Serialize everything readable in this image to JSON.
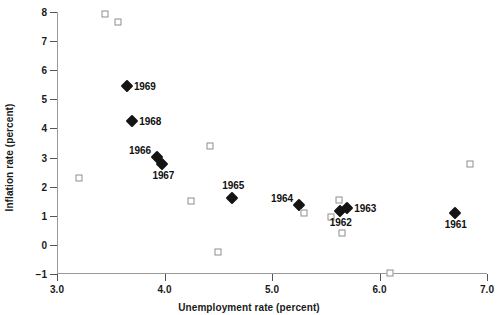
{
  "chart_data": {
    "type": "scatter",
    "title": "",
    "xlabel": "Unemployment rate (percent)",
    "ylabel": "Inflation rate (percent)",
    "xlim": [
      3.0,
      7.0
    ],
    "ylim": [
      -1,
      8
    ],
    "xticks": [
      "3.0",
      "4.0",
      "5.0",
      "6.0",
      "7.0"
    ],
    "xtick_values": [
      3.0,
      4.0,
      5.0,
      6.0,
      7.0
    ],
    "yticks": [
      "8",
      "7",
      "6",
      "5",
      "4",
      "3",
      "2",
      "1",
      "0",
      "−1"
    ],
    "ytick_values": [
      8,
      7,
      6,
      5,
      4,
      3,
      2,
      1,
      0,
      -1
    ],
    "grid": false,
    "legend": "none",
    "series": [
      {
        "name": "Labeled years (1961-1969)",
        "marker": "filled-diamond",
        "color": "#141414",
        "points": [
          {
            "label": "1969",
            "x": 3.65,
            "y": 5.45,
            "label_pos": "right"
          },
          {
            "label": "1968",
            "x": 3.7,
            "y": 4.25,
            "label_pos": "right"
          },
          {
            "label": "1966",
            "x": 3.93,
            "y": 3.03,
            "label_pos": "left"
          },
          {
            "label": "1967",
            "x": 3.98,
            "y": 2.78,
            "label_pos": "below"
          },
          {
            "label": "1965",
            "x": 4.63,
            "y": 1.6,
            "label_pos": "above"
          },
          {
            "label": "1964",
            "x": 5.25,
            "y": 1.38,
            "label_pos": "left"
          },
          {
            "label": "1962",
            "x": 5.63,
            "y": 1.18,
            "label_pos": "below"
          },
          {
            "label": "1963",
            "x": 5.7,
            "y": 1.27,
            "label_pos": "right"
          },
          {
            "label": "1961",
            "x": 6.7,
            "y": 1.1,
            "label_pos": "below"
          }
        ]
      },
      {
        "name": "Other years",
        "marker": "open-square",
        "color": "#8e8e8e",
        "points": [
          {
            "label": "",
            "x": 3.45,
            "y": 7.92
          },
          {
            "label": "",
            "x": 3.57,
            "y": 7.64
          },
          {
            "label": "",
            "x": 3.2,
            "y": 2.3
          },
          {
            "label": "",
            "x": 4.42,
            "y": 3.41
          },
          {
            "label": "",
            "x": 4.25,
            "y": 1.52
          },
          {
            "label": "",
            "x": 4.5,
            "y": -0.26
          },
          {
            "label": "",
            "x": 5.3,
            "y": 1.1
          },
          {
            "label": "",
            "x": 5.55,
            "y": 0.97
          },
          {
            "label": "",
            "x": 5.62,
            "y": 1.53
          },
          {
            "label": "",
            "x": 5.65,
            "y": 0.4
          },
          {
            "label": "",
            "x": 6.1,
            "y": -0.95
          },
          {
            "label": "",
            "x": 6.84,
            "y": 2.78
          }
        ]
      }
    ],
    "colors": {
      "diamond": "#141414",
      "square_edge": "#8e8e8e",
      "square_face": "#ffffff",
      "axis": "#9a9a9a",
      "text": "#1a1a1a",
      "background": "#ffffff"
    }
  }
}
